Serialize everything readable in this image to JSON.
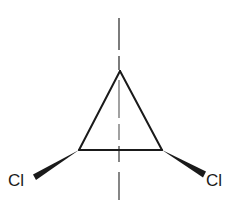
{
  "diagram": {
    "type": "chemical-structure",
    "molecule": "dichlorocyclopropane",
    "ink_color": "#1a1a1a",
    "background": "#ffffff",
    "ring": {
      "vertices": {
        "top": [
          120,
          71
        ],
        "left": [
          79,
          150
        ],
        "right": [
          162,
          150
        ]
      }
    },
    "substituents": [
      {
        "label": "Cl",
        "position": "lower-left",
        "bond": "wedge"
      },
      {
        "label": "Cl",
        "position": "lower-right",
        "bond": "wedge"
      }
    ],
    "symmetry_axis": {
      "style": "dashed",
      "orientation": "vertical"
    }
  }
}
